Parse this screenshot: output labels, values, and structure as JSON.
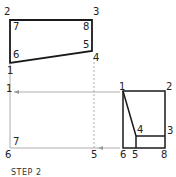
{
  "caption": "STEP 2",
  "top_view": {
    "labels": {
      "p2": "2",
      "p3": "3",
      "p7": "7",
      "p8": "8",
      "p6": "6",
      "p5": "5",
      "p4": "4",
      "p1": "1"
    }
  },
  "front_view": {
    "labels": {
      "p1": "1",
      "p7": "7",
      "p6": "6",
      "p5": "5"
    }
  },
  "side_view": {
    "labels": {
      "p1": "1",
      "p2": "2",
      "p4": "4",
      "p3": "3",
      "p6": "6",
      "p5": "5",
      "p8": "8"
    }
  },
  "colors": {
    "outline": "#1a1a1a",
    "projection": "#9a9a9a"
  }
}
